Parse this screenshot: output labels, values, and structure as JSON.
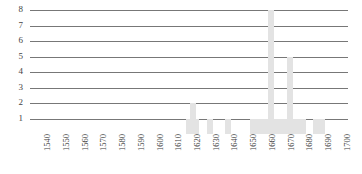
{
  "chart_data": {
    "type": "bar",
    "title": "",
    "subtitle": "",
    "xlabel": "",
    "ylabel": "",
    "xlim": [
      1535,
      1705
    ],
    "ylim": [
      0,
      8
    ],
    "grid": true,
    "legend": null,
    "bar_color": "#e3e3e3",
    "gridline_color": "#4a4a4a",
    "axis_text_color": "#3f3f3f",
    "y_ticks": [
      1,
      2,
      3,
      4,
      5,
      6,
      7,
      8
    ],
    "y_tick_labels": [
      "1",
      "2",
      "3",
      "4",
      "5",
      "6",
      "7",
      "8"
    ],
    "x_ticks": [
      1540,
      1550,
      1560,
      1570,
      1580,
      1590,
      1600,
      1610,
      1620,
      1630,
      1640,
      1650,
      1660,
      1670,
      1680,
      1690,
      1700
    ],
    "x_tick_labels": [
      "1540",
      "1550",
      "1560",
      "1570",
      "1580",
      "1590",
      "1600",
      "1610",
      "1620",
      "1630",
      "1640",
      "1650",
      "1660",
      "1670",
      "1680",
      "1690",
      "1700"
    ],
    "categories": [
      1620,
      1622,
      1624,
      1631,
      1641,
      1654,
      1657,
      1660,
      1662,
      1664,
      1666,
      1668,
      1670,
      1672,
      1674,
      1676,
      1678,
      1681,
      1688,
      1691
    ],
    "values": [
      1,
      2,
      1,
      1,
      1,
      1,
      1,
      1,
      1,
      8,
      1,
      1,
      1,
      1,
      5,
      1,
      1,
      1,
      1,
      1
    ],
    "series": [
      {
        "name": "count",
        "values": [
          1,
          2,
          1,
          1,
          1,
          1,
          1,
          1,
          1,
          8,
          1,
          1,
          1,
          1,
          5,
          1,
          1,
          1,
          1,
          1
        ]
      }
    ]
  }
}
